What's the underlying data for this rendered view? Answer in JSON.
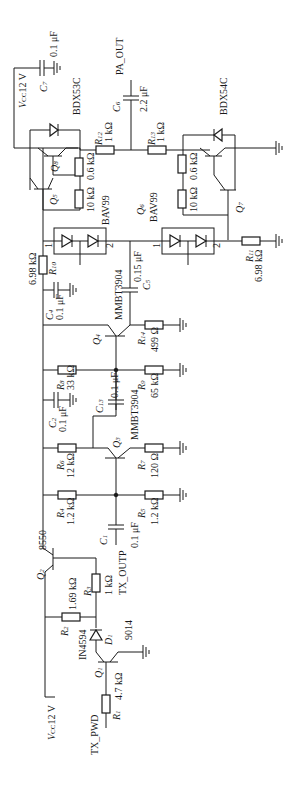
{
  "diagram": {
    "type": "circuit-schematic",
    "orientation": "rotated-90-ccw",
    "components": {
      "resistors": [
        {
          "ref": "R1",
          "value": "4.7 kΩ"
        },
        {
          "ref": "R2",
          "value": "1.69 kΩ"
        },
        {
          "ref": "R3",
          "value": "1 kΩ"
        },
        {
          "ref": "R4",
          "value": "1.2 kΩ"
        },
        {
          "ref": "R5",
          "value": "1.2 kΩ"
        },
        {
          "ref": "R6",
          "value": "12 kΩ"
        },
        {
          "ref": "R7",
          "value": "120 Ω"
        },
        {
          "ref": "R8",
          "value": "33 kΩ"
        },
        {
          "ref": "R9",
          "value": "65 kΩ"
        },
        {
          "ref": "R10",
          "value": "6.98 kΩ"
        },
        {
          "ref": "R11",
          "value": "6.98 kΩ"
        },
        {
          "ref": "R12",
          "value": "1 kΩ"
        },
        {
          "ref": "R13",
          "value": "1 kΩ"
        },
        {
          "ref": "R14",
          "value": "499 Ω"
        },
        {
          "ref": "Q5-bias-a",
          "value": "0.6 kΩ"
        },
        {
          "ref": "Q5-bias-b",
          "value": "10 kΩ"
        },
        {
          "ref": "Q7-bias-a",
          "value": "0.6 kΩ"
        },
        {
          "ref": "Q7-bias-b",
          "value": "10 kΩ"
        }
      ],
      "capacitors": [
        {
          "ref": "C1",
          "value": "0.1 μF"
        },
        {
          "ref": "C2",
          "value": "0.1 μF"
        },
        {
          "ref": "C4",
          "value": "0.1 μF"
        },
        {
          "ref": "C5",
          "value": "0.15 μF"
        },
        {
          "ref": "C6",
          "value": "2.2 μF"
        },
        {
          "ref": "C7",
          "value": "0.1 μF"
        },
        {
          "ref": "C13",
          "value": "0.1 μF"
        }
      ],
      "transistors": [
        {
          "ref": "Q1",
          "part": "9014"
        },
        {
          "ref": "Q2",
          "part": "8550"
        },
        {
          "ref": "Q3",
          "part": "MMBT3904"
        },
        {
          "ref": "Q4",
          "part": "MMBT3904"
        },
        {
          "ref": "Q5",
          "part": "BDX53C"
        },
        {
          "ref": "Q6",
          "part": "BAV99"
        },
        {
          "ref": "Q7",
          "part": "BDX54C"
        },
        {
          "ref": "Q8",
          "part": "BDX53C"
        }
      ],
      "diodes": [
        {
          "ref": "D1",
          "part": "IN4594"
        },
        {
          "ref": "BAV99-a",
          "part": "BAV99",
          "pins": [
            "1",
            "2"
          ]
        },
        {
          "ref": "BAV99-b",
          "part": "BAV99",
          "pins": [
            "1",
            "2"
          ]
        }
      ]
    },
    "nets": {
      "vcc_bottom": "VCC12 V",
      "vcc_top": "VCC12 V",
      "tx_pwd": "TX_PWD",
      "tx_outp": "TX_OUTP",
      "pa_out": "PA_OUT"
    },
    "labels": {
      "vcc_top_v": "V",
      "vcc_top_sub": "CC",
      "vcc_top_val": "12 V",
      "vcc_bot_v": "V",
      "vcc_bot_sub": "CC",
      "vcc_bot_val": "12 V",
      "tx_pwd": "TX_PWD",
      "tx_outp": "TX_OUTP",
      "pa_out": "PA_OUT",
      "r1": "R",
      "r1s": "1",
      "r1v": "4.7 kΩ",
      "r2": "R",
      "r2s": "2",
      "r2v": "1.69 kΩ",
      "r3": "R",
      "r3s": "3",
      "r3v": "1 kΩ",
      "r4": "R",
      "r4s": "4",
      "r4v": "1.2 kΩ",
      "r5": "R",
      "r5s": "5",
      "r5v": "1.2 kΩ",
      "r6": "R",
      "r6s": "6",
      "r6v": "12 kΩ",
      "r7": "R",
      "r7s": "7",
      "r7v": "120 Ω",
      "r8": "R",
      "r8s": "8",
      "r8v": "33 kΩ",
      "r9": "R",
      "r9s": "9",
      "r9v": "65 kΩ",
      "r10": "R",
      "r10s": "10",
      "r10v": "6.98 kΩ",
      "r11": "R",
      "r11s": "11",
      "r11v": "6.98 kΩ",
      "r12": "R",
      "r12s": "12",
      "r12v": "1 kΩ",
      "r13": "R",
      "r13s": "13",
      "r13v": "1 kΩ",
      "r14": "R",
      "r14s": "14",
      "r14v": "499 Ω",
      "rq5a": "0.6 kΩ",
      "rq5b": "10 kΩ",
      "rq7a": "0.6 kΩ",
      "rq7b": "10 kΩ",
      "c1": "C",
      "c1s": "1",
      "c1v": "0.1 μF",
      "c2": "C",
      "c2s": "2",
      "c2v": "0.1 μF",
      "c4": "C",
      "c4s": "4",
      "c4v": "0.1 μF",
      "c5": "C",
      "c5s": "5",
      "c5v": "0.15 μF",
      "c6": "C",
      "c6s": "6",
      "c6v": "2.2 μF",
      "c7": "C",
      "c7s": "7",
      "c7v": "0.1 μF",
      "c13": "C",
      "c13s": "13",
      "c13v": "0.1 μF",
      "q1": "Q",
      "q1s": "1",
      "q1p": "9014",
      "q2": "Q",
      "q2s": "2",
      "q2p": "8550",
      "q3": "Q",
      "q3s": "3",
      "q3p": "MMBT3904",
      "q4": "Q",
      "q4s": "4",
      "q4p": "MMBT3904",
      "q5": "Q",
      "q5s": "5",
      "q6": "Q",
      "q6s": "6",
      "q7": "Q",
      "q7s": "7",
      "q8": "Q",
      "q8s": "8",
      "bdx53c": "BDX53C",
      "bdx54c": "BDX54C",
      "bav99a": "BAV99",
      "bav99b": "BAV99",
      "d1": "D",
      "d1s": "1",
      "d1p": "IN4594",
      "pin1": "1",
      "pin2": "2"
    }
  }
}
